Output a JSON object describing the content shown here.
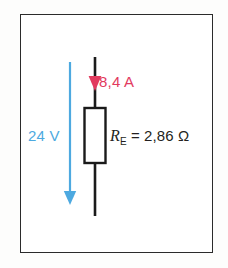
{
  "figure": {
    "background_color": "#ffffff",
    "frame_color": "#2b2b2b"
  },
  "diagram": {
    "type": "circuit-schematic",
    "components": [
      {
        "name": "resistor",
        "shape": "rectangle",
        "label_symbol": "R",
        "label_subscript": "E",
        "value": "2,86",
        "unit": "Ω",
        "full_label": "R_E = 2,86 Ω",
        "color": "#231f20"
      }
    ],
    "arrows": [
      {
        "name": "current-arrow",
        "direction": "down",
        "color": "#e23a5e",
        "quantity": "current"
      },
      {
        "name": "voltage-arrow",
        "direction": "down",
        "color": "#4da9e0",
        "quantity": "voltage"
      }
    ]
  },
  "labels": {
    "current": "8,4 A",
    "voltage": "24 V",
    "resistance_symbol": "R",
    "resistance_subscript": "E",
    "resistance_equation": " = 2,86 Ω"
  },
  "colors": {
    "current_red": "#e23a5e",
    "voltage_blue": "#4da9e0",
    "wire_black": "#1a1a1a",
    "frame": "#2b2b2b"
  }
}
